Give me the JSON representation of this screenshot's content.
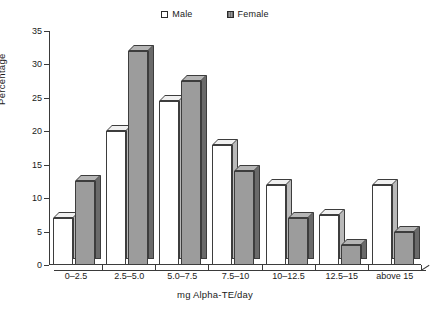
{
  "chart_data": {
    "type": "bar",
    "title": "",
    "xlabel": "mg Alpha-TE/day",
    "ylabel": "Percentage",
    "categories": [
      "0–2.5",
      "2.5–5.0",
      "5.0–7.5",
      "7.5–10",
      "10–12.5",
      "12.5–15",
      "above 15"
    ],
    "series": [
      {
        "name": "Male",
        "values": [
          7,
          20,
          24.5,
          18,
          12,
          7.5,
          12
        ]
      },
      {
        "name": "Female",
        "values": [
          12.5,
          32,
          27.5,
          14,
          7,
          3,
          5
        ]
      }
    ],
    "ylim": [
      0,
      35
    ],
    "yticks": [
      "0",
      "5",
      "10",
      "15",
      "20",
      "25",
      "30",
      "35"
    ],
    "ytick_values": [
      0,
      5,
      10,
      15,
      20,
      25,
      30,
      35
    ],
    "grid": false,
    "legend_position": "top-center",
    "style": "3d-column",
    "colors": {
      "male": "#ffffff",
      "female": "#9c9c9c",
      "outline": "#3d3d3d",
      "axis": "#3a3a3a"
    }
  },
  "legend": {
    "items": [
      {
        "label": "Male",
        "swatch": "male"
      },
      {
        "label": "Female",
        "swatch": "female"
      }
    ]
  },
  "axes": {
    "y_title": "Percentage",
    "x_title": "mg Alpha-TE/day"
  }
}
